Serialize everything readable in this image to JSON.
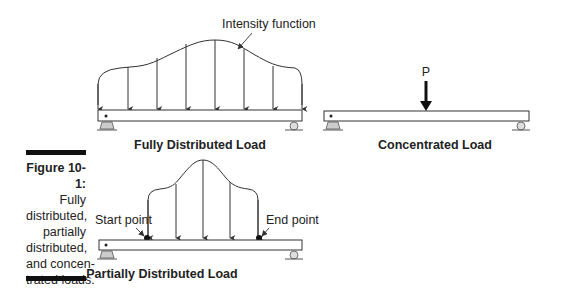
{
  "figure": {
    "number_label": "Figure 10-1:",
    "caption_lines": [
      "Fully",
      "distributed,",
      "partially",
      "distributed,",
      "and concen-",
      "trated loads."
    ]
  },
  "diagrams": {
    "fully_distributed": {
      "title": "Fully Distributed Load",
      "annotation": "Intensity function",
      "arrow_count": 8
    },
    "concentrated": {
      "title": "Concentrated Load",
      "load_label": "P"
    },
    "partially_distributed": {
      "title": "Partially Distributed Load",
      "start_label": "Start point",
      "end_label": "End point",
      "arrow_count": 6
    }
  },
  "colors": {
    "line": "#333333",
    "support_fill": "#cccccc",
    "caption_bar": "#111111"
  }
}
